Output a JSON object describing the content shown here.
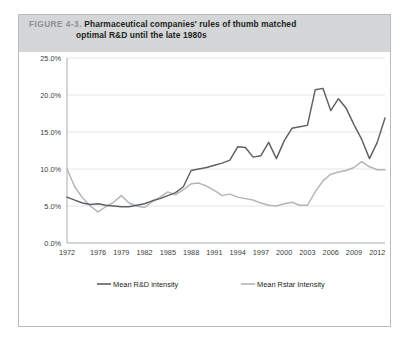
{
  "figure": {
    "number_label": "FIGURE 4-3.",
    "title_line1": "Pharmaceutical companies' rules of thumb matched",
    "title_line2": "optimal R&D until the late 1980s",
    "header_bg": "#d4d6d8",
    "border_color": "#b9bcbe"
  },
  "chart_data": {
    "type": "line",
    "title": "Pharmaceutical companies' rules of thumb matched optimal R&D until the late 1980s",
    "xlabel": "",
    "ylabel": "",
    "ylim": [
      0,
      25
    ],
    "ytick_labels": [
      "0.0%",
      "5.0%",
      "10.0%",
      "15.0%",
      "20.0%",
      "25.0%"
    ],
    "ytick_values": [
      0,
      5,
      10,
      15,
      20,
      25
    ],
    "xtick_labels": [
      "1972",
      "1976",
      "1979",
      "1982",
      "1985",
      "1988",
      "1991",
      "1994",
      "1997",
      "2000",
      "2003",
      "2006",
      "2009",
      "2012"
    ],
    "xtick_values": [
      1972,
      1976,
      1979,
      1982,
      1985,
      1988,
      1991,
      1994,
      1997,
      2000,
      2003,
      2006,
      2009,
      2012
    ],
    "xlim": [
      1972,
      2013
    ],
    "grid": true,
    "legend_position": "bottom",
    "x": [
      1972,
      1973,
      1974,
      1975,
      1976,
      1977,
      1978,
      1979,
      1980,
      1981,
      1982,
      1983,
      1984,
      1985,
      1986,
      1987,
      1988,
      1989,
      1990,
      1991,
      1992,
      1993,
      1994,
      1995,
      1996,
      1997,
      1998,
      1999,
      2000,
      2001,
      2002,
      2003,
      2004,
      2005,
      2006,
      2007,
      2008,
      2009,
      2010,
      2011,
      2012,
      2013
    ],
    "series": [
      {
        "name": "Mean R&D intensity",
        "color": "#5d6164",
        "values": [
          6.2,
          5.8,
          5.4,
          5.2,
          5.3,
          5.1,
          5.0,
          4.9,
          4.9,
          5.1,
          5.3,
          5.7,
          6.0,
          6.4,
          6.8,
          7.6,
          9.8,
          10.0,
          10.2,
          10.5,
          10.8,
          11.2,
          13.0,
          12.9,
          11.6,
          11.8,
          13.6,
          11.4,
          13.8,
          15.5,
          15.7,
          15.9,
          20.7,
          20.9,
          17.9,
          19.5,
          18.2,
          16.0,
          14.0,
          11.4,
          13.6,
          16.9
        ]
      },
      {
        "name": "Mean Rstar Intensity",
        "color": "#b2b5b8",
        "values": [
          10.0,
          7.6,
          6.1,
          5.0,
          4.2,
          4.9,
          5.5,
          6.4,
          5.4,
          5.0,
          4.8,
          5.6,
          6.2,
          6.9,
          6.5,
          7.2,
          8.0,
          8.1,
          7.7,
          7.1,
          6.4,
          6.6,
          6.2,
          6.0,
          5.8,
          5.4,
          5.1,
          5.0,
          5.3,
          5.5,
          5.1,
          5.1,
          6.9,
          8.4,
          9.3,
          9.6,
          9.8,
          10.2,
          11.0,
          10.3,
          9.9,
          9.9
        ]
      }
    ]
  },
  "legend": {
    "items": [
      {
        "label": "Mean R&D intensity",
        "color": "#5d6164"
      },
      {
        "label": "Mean Rstar Intensity",
        "color": "#b2b5b8"
      }
    ]
  }
}
